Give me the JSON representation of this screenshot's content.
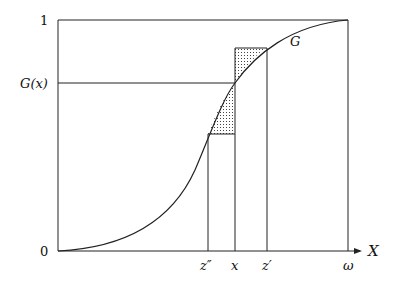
{
  "diagram": {
    "y_labels": {
      "one": "1",
      "gx": "G(x)",
      "zero": "0"
    },
    "x_labels": {
      "z_double_prime": "z″",
      "x": "x",
      "z_prime": "z′",
      "omega": "ω"
    },
    "axis_label": "X",
    "curve_label": "G",
    "colors": {
      "stroke": "#222222",
      "dots": "#444444"
    }
  }
}
